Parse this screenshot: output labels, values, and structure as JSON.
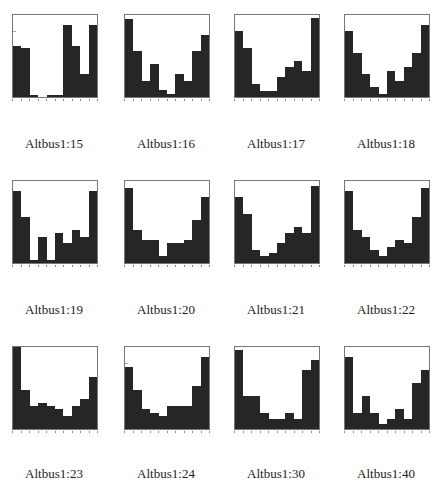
{
  "figure": {
    "captions": [
      "Altbus1:15",
      "Altbus1:16",
      "Altbus1:17",
      "Altbus1:18",
      "Altbus1:19",
      "Altbus1:20",
      "Altbus1:21",
      "Altbus1:22",
      "Altbus1:23",
      "Altbus1:24",
      "Altbus1:30",
      "Altbus1:40"
    ]
  },
  "chart_data": [
    {
      "type": "bar",
      "title": "Altbus1:15",
      "categories": [
        "-0.9",
        "-0.7",
        "-0.5",
        "-0.3",
        "-0.1",
        "0.1",
        "0.3",
        "0.5",
        "0.7",
        "0.9"
      ],
      "values": [
        0.62,
        0.6,
        0.02,
        0.0,
        0.02,
        0.02,
        0.88,
        0.62,
        0.28,
        0.88
      ],
      "xlim": [
        -1,
        1
      ],
      "ylim": [
        0,
        1
      ]
    },
    {
      "type": "bar",
      "title": "Altbus1:16",
      "categories": [
        "-0.9",
        "-0.7",
        "-0.5",
        "-0.3",
        "-0.1",
        "0.1",
        "0.3",
        "0.5",
        "0.7",
        "0.9"
      ],
      "values": [
        0.95,
        0.56,
        0.2,
        0.4,
        0.08,
        0.04,
        0.28,
        0.2,
        0.56,
        0.76
      ],
      "xlim": [
        -1,
        1
      ],
      "ylim": [
        0,
        1
      ]
    },
    {
      "type": "bar",
      "title": "Altbus1:17",
      "categories": [
        "-0.9",
        "-0.7",
        "-0.5",
        "-0.3",
        "-0.1",
        "0.1",
        "0.3",
        "0.5",
        "0.7",
        "0.9"
      ],
      "values": [
        0.8,
        0.6,
        0.16,
        0.07,
        0.07,
        0.24,
        0.36,
        0.44,
        0.32,
        0.96
      ],
      "xlim": [
        -1,
        1
      ],
      "ylim": [
        0,
        1
      ]
    },
    {
      "type": "bar",
      "title": "Altbus1:18",
      "categories": [
        "-0.9",
        "-0.7",
        "-0.5",
        "-0.3",
        "-0.1",
        "0.1",
        "0.3",
        "0.5",
        "0.7",
        "0.9"
      ],
      "values": [
        0.8,
        0.54,
        0.28,
        0.12,
        0.04,
        0.32,
        0.2,
        0.36,
        0.54,
        0.88
      ],
      "xlim": [
        -1,
        1
      ],
      "ylim": [
        0,
        1
      ]
    },
    {
      "type": "bar",
      "title": "Altbus1:19",
      "categories": [
        "-0.9",
        "-0.7",
        "-0.5",
        "-0.3",
        "-0.1",
        "0.1",
        "0.3",
        "0.5",
        "0.7",
        "0.9"
      ],
      "values": [
        0.88,
        0.56,
        0.04,
        0.32,
        0.04,
        0.36,
        0.24,
        0.4,
        0.32,
        0.88
      ],
      "xlim": [
        -1,
        1
      ],
      "ylim": [
        0,
        1
      ]
    },
    {
      "type": "bar",
      "title": "Altbus1:20",
      "categories": [
        "-0.9",
        "-0.7",
        "-0.5",
        "-0.3",
        "-0.1",
        "0.1",
        "0.3",
        "0.5",
        "0.7",
        "0.9"
      ],
      "values": [
        0.92,
        0.4,
        0.28,
        0.28,
        0.08,
        0.24,
        0.24,
        0.28,
        0.52,
        0.8
      ],
      "xlim": [
        -1,
        1
      ],
      "ylim": [
        0,
        1
      ]
    },
    {
      "type": "bar",
      "title": "Altbus1:21",
      "categories": [
        "-0.9",
        "-0.7",
        "-0.5",
        "-0.3",
        "-0.1",
        "0.1",
        "0.3",
        "0.5",
        "0.7",
        "0.9"
      ],
      "values": [
        0.8,
        0.6,
        0.16,
        0.08,
        0.12,
        0.24,
        0.36,
        0.44,
        0.36,
        0.94
      ],
      "xlim": [
        -1,
        1
      ],
      "ylim": [
        0,
        1
      ]
    },
    {
      "type": "bar",
      "title": "Altbus1:22",
      "categories": [
        "-0.9",
        "-0.7",
        "-0.5",
        "-0.3",
        "-0.1",
        "0.1",
        "0.3",
        "0.5",
        "0.7",
        "0.9"
      ],
      "values": [
        0.88,
        0.4,
        0.32,
        0.16,
        0.08,
        0.2,
        0.28,
        0.24,
        0.56,
        0.92
      ],
      "xlim": [
        -1,
        1
      ],
      "ylim": [
        0,
        1
      ]
    },
    {
      "type": "bar",
      "title": "Altbus1:23",
      "categories": [
        "-0.9",
        "-0.7",
        "-0.5",
        "-0.3",
        "-0.1",
        "0.1",
        "0.3",
        "0.5",
        "0.7",
        "0.9"
      ],
      "values": [
        1.0,
        0.48,
        0.28,
        0.32,
        0.28,
        0.24,
        0.16,
        0.28,
        0.36,
        0.64
      ],
      "xlim": [
        -1,
        1
      ],
      "ylim": [
        0,
        1
      ]
    },
    {
      "type": "bar",
      "title": "Altbus1:24",
      "categories": [
        "-0.9",
        "-0.7",
        "-0.5",
        "-0.3",
        "-0.1",
        "0.1",
        "0.3",
        "0.5",
        "0.7",
        "0.9"
      ],
      "values": [
        0.76,
        0.48,
        0.24,
        0.2,
        0.16,
        0.28,
        0.28,
        0.28,
        0.52,
        0.88
      ],
      "xlim": [
        -1,
        1
      ],
      "ylim": [
        0,
        1
      ]
    },
    {
      "type": "bar",
      "title": "Altbus1:30",
      "categories": [
        "-0.9",
        "-0.7",
        "-0.5",
        "-0.3",
        "-0.1",
        "0.1",
        "0.3",
        "0.5",
        "0.7",
        "0.9"
      ],
      "values": [
        0.96,
        0.4,
        0.4,
        0.2,
        0.12,
        0.12,
        0.2,
        0.12,
        0.72,
        0.84
      ],
      "xlim": [
        -1,
        1
      ],
      "ylim": [
        0,
        1
      ]
    },
    {
      "type": "bar",
      "title": "Altbus1:40",
      "categories": [
        "-0.9",
        "-0.7",
        "-0.5",
        "-0.3",
        "-0.1",
        "0.1",
        "0.3",
        "0.5",
        "0.7",
        "0.9"
      ],
      "values": [
        0.88,
        0.2,
        0.4,
        0.2,
        0.06,
        0.12,
        0.24,
        0.12,
        0.56,
        0.72
      ],
      "xlim": [
        -1,
        1
      ],
      "ylim": [
        0,
        1
      ]
    }
  ]
}
